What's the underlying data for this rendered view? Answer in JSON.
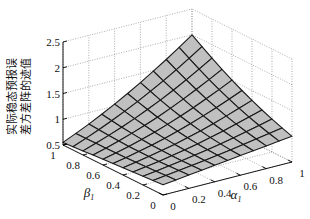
{
  "chart_data": {
    "type": "surface",
    "title": "",
    "xlabel": "α₁",
    "ylabel": "β₁",
    "zlabel": [
      "实际稳态预报误",
      "差方差阵的迹值"
    ],
    "x_ticks": [
      "0",
      "0.2",
      "0.4",
      "0.6",
      "0.8",
      "1"
    ],
    "y_ticks": [
      "0",
      "0.2",
      "0.4",
      "0.6",
      "0.8",
      "1"
    ],
    "z_ticks": [
      "0.5",
      "1",
      "1.5",
      "2",
      "2.5"
    ],
    "xlim": [
      0,
      1
    ],
    "ylim": [
      0,
      1
    ],
    "zlim": [
      0.5,
      2.5
    ],
    "grid": true,
    "grid_resolution": 11,
    "surface_corners": {
      "alpha0_beta0": 0.7,
      "alpha1_beta0": 1.0,
      "alpha0_beta1": 0.55,
      "alpha1_beta1": 2.0
    },
    "surface_color": "#c0c0c0",
    "mesh_color": "#1a1a1a"
  }
}
